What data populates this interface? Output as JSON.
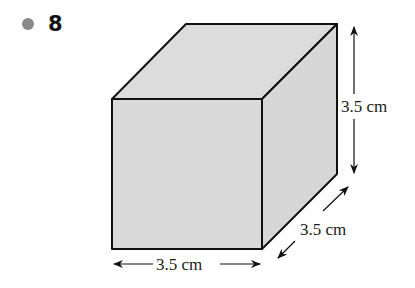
{
  "question": {
    "number": "8",
    "bullet_color": "#8a8a8a"
  },
  "figure": {
    "shape": "cube",
    "fill_color": "#d9d9d9",
    "edge_color": "#111111",
    "dimensions": {
      "height": "3.5 cm",
      "depth": "3.5 cm",
      "width": "3.5 cm"
    }
  }
}
